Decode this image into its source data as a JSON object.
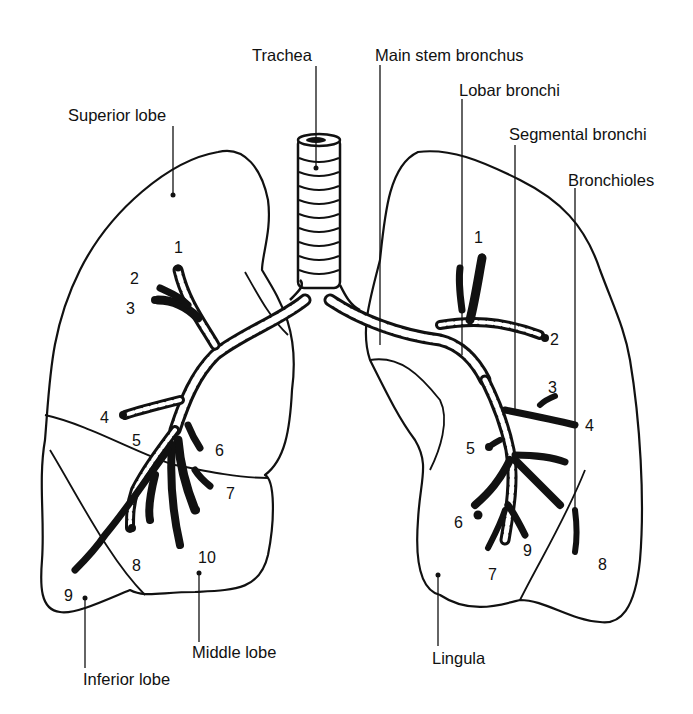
{
  "diagram": {
    "structure_labels": {
      "trachea": "Trachea",
      "main_stem_bronchus": "Main stem bronchus",
      "lobar_bronchi": "Lobar bronchi",
      "segmental_bronchi": "Segmental bronchi",
      "bronchioles": "Bronchioles"
    },
    "right_lung": {
      "superior_lobe": "Superior lobe",
      "middle_lobe": "Middle lobe",
      "inferior_lobe": "Inferior lobe",
      "segments": [
        "1",
        "2",
        "3",
        "4",
        "5",
        "6",
        "7",
        "8",
        "9",
        "10"
      ]
    },
    "left_lung": {
      "lingula": "Lingula",
      "segments": [
        "1",
        "2",
        "3",
        "4",
        "5",
        "6",
        "7",
        "8",
        "9"
      ]
    },
    "colors": {
      "ink": "#111111",
      "background": "#ffffff"
    }
  }
}
